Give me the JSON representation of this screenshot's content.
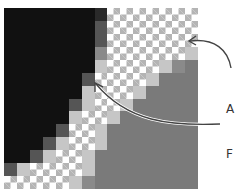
{
  "diagram": {
    "grid": {
      "cols": 15,
      "rows": 14,
      "legend": {
        "B": "black pixel",
        "D": "dark gray blended edge pixel",
        "M": "medium gray blended edge pixel",
        "L": "light gray blended edge pixel",
        "C": "transparent (checkerboard) pixel",
        "G": "gray fill pixel"
      },
      "colors": {
        "B": "#111111",
        "K": "#2a2a2a",
        "D": "#555555",
        "M": "#8a8a8a",
        "L": "#c6c6c6",
        "G": "#7a7a7a",
        "C": "checker"
      },
      "rows_data": [
        "BBBBBBBKCCCCCCC",
        "BBBBBBBDCCCCCCC",
        "BBBBBBBDCCCCCCC",
        "BBBBBBBMCCCCCCL",
        "BBBBBBBLCCCCLMG",
        "BBBBBBDCCCCLGGG",
        "BBBBBBLCCCLGGGG",
        "BBBBBDLCCLGGGGG",
        "BBBBBLCCLGGGGGG",
        "BBBBDCCLGGGGGGG",
        "BBBDLCCLGGGGGGG",
        "BBDLCCLGGGGGGGG",
        "DLCCCCLGGGGGGGG",
        "CCCCCLMGGGGGGGG"
      ]
    },
    "callout": {
      "lines": [
        "A",
        "F",
        "a",
        "c"
      ]
    },
    "arrows": [
      {
        "name": "arrow-to-transparent-edge"
      },
      {
        "name": "arrow-to-black-edge"
      }
    ]
  }
}
